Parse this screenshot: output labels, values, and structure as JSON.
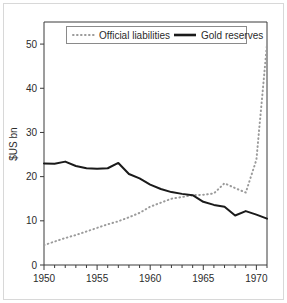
{
  "chart_data": {
    "type": "line",
    "title": "",
    "xlabel": "",
    "ylabel": "$US bn",
    "xlim": [
      1950,
      1971
    ],
    "ylim": [
      0,
      55
    ],
    "grid": false,
    "legend_position": "top-center",
    "y_ticks": [
      0,
      10,
      20,
      30,
      40,
      50
    ],
    "y_tick_labels": [
      "0",
      "10",
      "20",
      "30",
      "40",
      "50"
    ],
    "x_ticks": [
      1950,
      1955,
      1960,
      1965,
      1970
    ],
    "x_tick_labels": [
      "1950",
      "1955",
      "1960",
      "1965",
      "1970"
    ],
    "x_minor_ticks": [
      1951,
      1952,
      1953,
      1954,
      1956,
      1957,
      1958,
      1959,
      1961,
      1962,
      1963,
      1964,
      1966,
      1967,
      1968,
      1969,
      1971
    ],
    "x": [
      1950,
      1951,
      1952,
      1953,
      1954,
      1955,
      1956,
      1957,
      1958,
      1959,
      1960,
      1961,
      1962,
      1963,
      1964,
      1965,
      1966,
      1967,
      1968,
      1969,
      1970,
      1971
    ],
    "series": [
      {
        "name": "Official liabilities",
        "style": "dotted",
        "color": "#9b9b9b",
        "values": [
          4.5,
          5.3,
          6.1,
          6.8,
          7.6,
          8.4,
          9.2,
          9.9,
          10.8,
          11.8,
          13.2,
          14.1,
          15.0,
          15.4,
          15.8,
          15.9,
          16.2,
          18.5,
          17.4,
          16.4,
          23.8,
          50.0
        ]
      },
      {
        "name": "Gold reserves",
        "style": "solid",
        "color": "#1a1a1a",
        "values": [
          23.0,
          22.9,
          23.4,
          22.4,
          21.9,
          21.8,
          21.9,
          23.1,
          20.6,
          19.6,
          18.2,
          17.2,
          16.5,
          16.1,
          15.8,
          14.3,
          13.6,
          13.2,
          11.2,
          12.2,
          11.4,
          10.5
        ]
      }
    ]
  },
  "legend": {
    "items": [
      {
        "label": "Official liabilities",
        "style": "dotted"
      },
      {
        "label": "Gold reserves",
        "style": "solid"
      }
    ]
  },
  "colors": {
    "solid_series": "#1a1a1a",
    "dotted_series": "#9b9b9b",
    "axis": "#3a3a3a",
    "frame": "#d8d8d8",
    "background": "#ffffff"
  }
}
